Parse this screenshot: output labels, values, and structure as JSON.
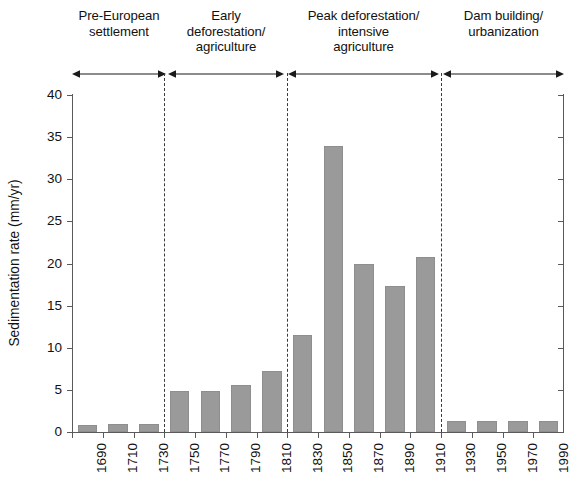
{
  "chart_data": {
    "type": "bar",
    "title": "",
    "subtitle": "",
    "xlabel": "",
    "ylabel": "Sedimentation rate (mm/yr)",
    "ylim": [
      0,
      40
    ],
    "yticks": [
      0,
      5,
      10,
      15,
      20,
      25,
      30,
      35,
      40
    ],
    "grid": false,
    "legend": null,
    "bar_color": "#9a9a9a",
    "categories": [
      "1690",
      "1710",
      "1730",
      "1750",
      "1770",
      "1790",
      "1810",
      "1830",
      "1850",
      "1870",
      "1890",
      "1910",
      "1930",
      "1950",
      "1970",
      "1990"
    ],
    "values": [
      0.8,
      0.9,
      0.9,
      4.9,
      4.9,
      5.6,
      7.2,
      11.5,
      34.0,
      20.0,
      17.3,
      20.8,
      1.3,
      1.3,
      1.3,
      1.3
    ],
    "annotations": {
      "phases": [
        {
          "lines": [
            "Pre-European",
            "settlement"
          ],
          "start_category": "1690",
          "end_category": "1730"
        },
        {
          "lines": [
            "Early",
            "deforestation/",
            "agriculture"
          ],
          "start_category": "1750",
          "end_category": "1810"
        },
        {
          "lines": [
            "Peak deforestation/",
            "intensive",
            "agriculture"
          ],
          "start_category": "1830",
          "end_category": "1910"
        },
        {
          "lines": [
            "Dam building/",
            "urbanization"
          ],
          "start_category": "1930",
          "end_category": "1990"
        }
      ],
      "divider_style": "dashed-vertical",
      "divider_count": 3
    }
  }
}
